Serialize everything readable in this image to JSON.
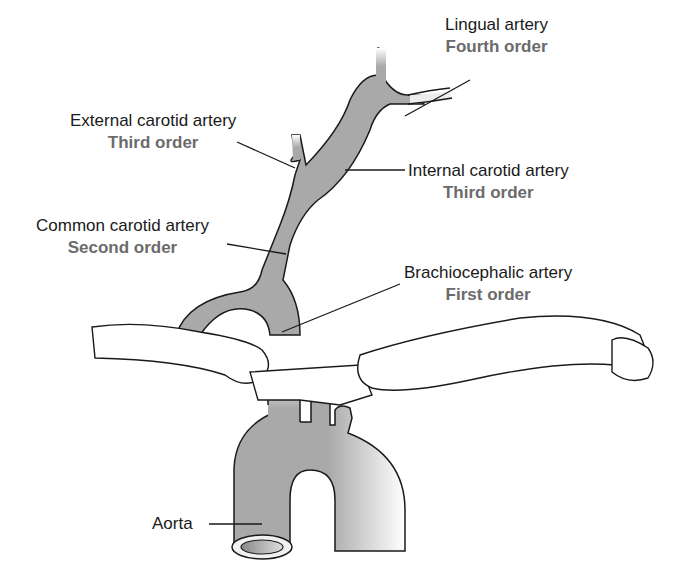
{
  "diagram": {
    "colors": {
      "vessel_fill": "#a9a9a9",
      "outline": "#1a1a1a",
      "bone_fill": "#ffffff",
      "name_text": "#1a1a1a",
      "order_text": "#6b6b6b"
    },
    "labels": [
      {
        "id": "lingual",
        "name": "Lingual artery",
        "order": "Fourth order"
      },
      {
        "id": "external-carotid",
        "name": "External carotid artery",
        "order": "Third order"
      },
      {
        "id": "internal-carotid",
        "name": "Internal carotid artery",
        "order": "Third order"
      },
      {
        "id": "common-carotid",
        "name": "Common carotid artery",
        "order": "Second order"
      },
      {
        "id": "brachiocephalic",
        "name": "Brachiocephalic artery",
        "order": "First order"
      },
      {
        "id": "aorta",
        "name": "Aorta",
        "order": ""
      }
    ]
  }
}
